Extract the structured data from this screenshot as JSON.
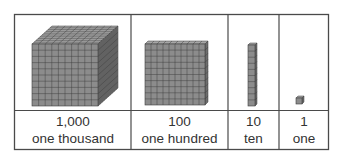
{
  "colors": {
    "border": "#4a4a4a",
    "block_front": "#8c8c8c",
    "block_top": "#a6a6a6",
    "block_side": "#6e6e6e",
    "grid_line": "#3c3c3c"
  },
  "columns": [
    {
      "id": "thousand",
      "number": "1,000",
      "word": "one thousand",
      "block": "cube"
    },
    {
      "id": "hundred",
      "number": "100",
      "word": "one hundred",
      "block": "flat"
    },
    {
      "id": "ten",
      "number": "10",
      "word": "ten",
      "block": "rod"
    },
    {
      "id": "one",
      "number": "1",
      "word": "one",
      "block": "unit"
    }
  ]
}
